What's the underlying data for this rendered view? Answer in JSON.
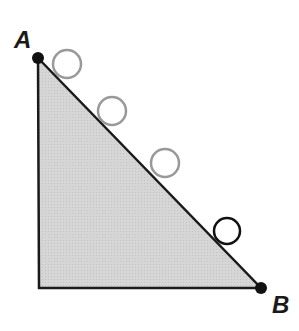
{
  "diagram": {
    "colors": {
      "triangle_fill": "#d4d4d4",
      "triangle_stroke": "#1a1a1a",
      "ghost_ball_stroke": "#999999",
      "current_ball_stroke": "#111111",
      "point_fill": "#111111"
    },
    "points": [
      {
        "label": "A",
        "x": 38,
        "y": 58,
        "label_x": 14,
        "label_y": 48
      },
      {
        "label": "B",
        "x": 261,
        "y": 288,
        "label_x": 272,
        "label_y": 313
      }
    ],
    "corner": {
      "x": 39,
      "y": 288
    },
    "balls": [
      {
        "cx": 67,
        "cy": 64,
        "r": 14,
        "state": "ghost"
      },
      {
        "cx": 112,
        "cy": 111,
        "r": 14,
        "state": "ghost"
      },
      {
        "cx": 165,
        "cy": 163,
        "r": 14,
        "state": "ghost"
      },
      {
        "cx": 227,
        "cy": 231,
        "r": 13,
        "state": "current"
      }
    ]
  }
}
